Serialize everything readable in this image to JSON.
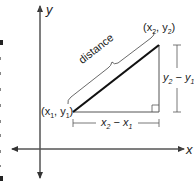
{
  "diagram": {
    "type": "distance-formula-right-triangle",
    "axes": {
      "x_label": "x",
      "y_label": "y"
    },
    "points": {
      "p1": {
        "label": "(x",
        "sub": "1",
        "mid": ", y",
        "sub2": "1",
        "close": ")"
      },
      "p2": {
        "label": "(x",
        "sub": "2",
        "mid": ", y",
        "sub2": "2",
        "close": ")"
      }
    },
    "hypotenuse_label": "distance",
    "horizontal_leg_label": {
      "a": "x",
      "a_sub": "2",
      "op": " − ",
      "b": "x",
      "b_sub": "1"
    },
    "vertical_leg_label": {
      "a": "y",
      "a_sub": "2",
      "op": " − ",
      "b": "y",
      "b_sub": "1"
    },
    "colors": {
      "axis": "#444444",
      "hypotenuse": "#111111",
      "legs": "#555555",
      "text": "#222222"
    }
  }
}
